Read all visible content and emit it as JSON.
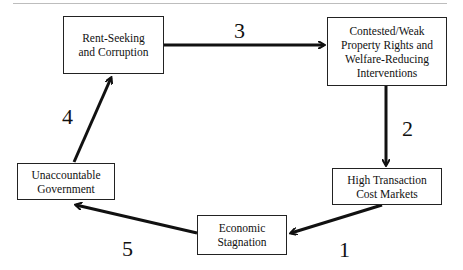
{
  "diagram": {
    "type": "cycle",
    "nodes": [
      {
        "id": "rent_seeking",
        "label": "Rent-Seeking\nand Corruption"
      },
      {
        "id": "contested",
        "label": "Contested/Weak\nProperty Rights and\nWelfare-Reducing\nInterventions"
      },
      {
        "id": "high_tc",
        "label": "High Transaction\nCost Markets"
      },
      {
        "id": "stagnation",
        "label": "Economic\nStagnation"
      },
      {
        "id": "unaccountable",
        "label": "Unaccountable\nGovernment"
      }
    ],
    "edges": [
      {
        "from": "high_tc",
        "to": "stagnation",
        "label": "1"
      },
      {
        "from": "contested",
        "to": "high_tc",
        "label": "2"
      },
      {
        "from": "rent_seeking",
        "to": "contested",
        "label": "3"
      },
      {
        "from": "unaccountable",
        "to": "rent_seeking",
        "label": "4"
      },
      {
        "from": "stagnation",
        "to": "unaccountable",
        "label": "5"
      }
    ],
    "colors": {
      "stroke": "#111111",
      "rule": "#bdbdbd"
    }
  }
}
